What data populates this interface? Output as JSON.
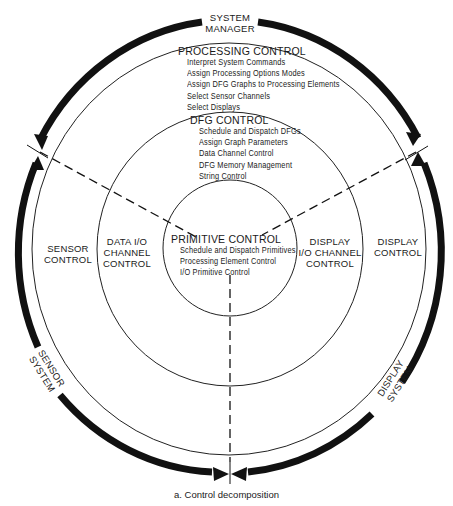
{
  "diagram": {
    "system_manager": [
      "SYSTEM",
      "MANAGER"
    ],
    "processing_control": {
      "title": "PROCESSING CONTROL",
      "items": [
        "Interpret System Commands",
        "Assign Processing Options Modes",
        "Assign DFG Graphs to Processing Elements",
        "Select Sensor Channels",
        "Select Displays"
      ]
    },
    "dfg_control": {
      "title": "DFG CONTROL",
      "items": [
        "Schedule and Dispatch DFGs",
        "Assign Graph Parameters",
        "Data Channel Control",
        "DFG Memory Management",
        "String Control"
      ]
    },
    "primitive_control": {
      "title": "PRIMITIVE CONTROL",
      "items": [
        "Schedule and Dispatch Primitives",
        "Processing Element Control",
        "I/O Primitive Control"
      ]
    },
    "sensor_control": [
      "SENSOR",
      "CONTROL"
    ],
    "data_io_channel_control": [
      "DATA I/O",
      "CHANNEL",
      "CONTROL"
    ],
    "display_io_channel_control": [
      "DISPLAY",
      "I/O CHANNEL",
      "CONTROL"
    ],
    "display_control": [
      "DISPLAY",
      "CONTROL"
    ],
    "sensor_system": [
      "SENSOR",
      "SYSTEM"
    ],
    "display_system": [
      "DISPLAY",
      "SYSTEM"
    ],
    "caption": "a. Control decomposition"
  }
}
